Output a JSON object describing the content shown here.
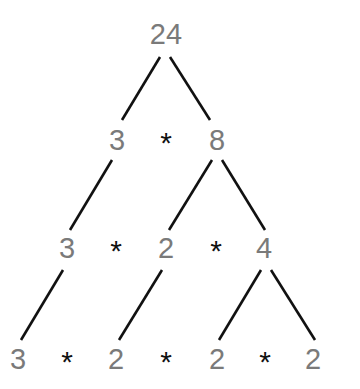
{
  "diagram": {
    "type": "factor-tree",
    "root": "24",
    "colors": {
      "number": "#7a7a7a",
      "operator": "#111111",
      "edge": "#111111",
      "background": "#ffffff"
    },
    "rows": [
      {
        "tokens": [
          {
            "text": "24",
            "kind": "num",
            "x": 166,
            "y": 34
          }
        ]
      },
      {
        "tokens": [
          {
            "text": "3",
            "kind": "num",
            "x": 117,
            "y": 140
          },
          {
            "text": "*",
            "kind": "op",
            "x": 166,
            "y": 143
          },
          {
            "text": "8",
            "kind": "num",
            "x": 217,
            "y": 140
          }
        ]
      },
      {
        "tokens": [
          {
            "text": "3",
            "kind": "num",
            "x": 67,
            "y": 248
          },
          {
            "text": "*",
            "kind": "op",
            "x": 116,
            "y": 251
          },
          {
            "text": "2",
            "kind": "num",
            "x": 166,
            "y": 248
          },
          {
            "text": "*",
            "kind": "op",
            "x": 216,
            "y": 251
          },
          {
            "text": "4",
            "kind": "num",
            "x": 264,
            "y": 248
          }
        ]
      },
      {
        "tokens": [
          {
            "text": "3",
            "kind": "num",
            "x": 18,
            "y": 359
          },
          {
            "text": "*",
            "kind": "op",
            "x": 67,
            "y": 362
          },
          {
            "text": "2",
            "kind": "num",
            "x": 116,
            "y": 359
          },
          {
            "text": "*",
            "kind": "op",
            "x": 166,
            "y": 362
          },
          {
            "text": "2",
            "kind": "num",
            "x": 217,
            "y": 359
          },
          {
            "text": "*",
            "kind": "op",
            "x": 265,
            "y": 362
          },
          {
            "text": "2",
            "kind": "num",
            "x": 313,
            "y": 359
          }
        ]
      }
    ],
    "edges": [
      {
        "from": "24",
        "to": "3",
        "x1": 160,
        "y1": 57,
        "x2": 122,
        "y2": 120
      },
      {
        "from": "24",
        "to": "8",
        "x1": 170,
        "y1": 57,
        "x2": 210,
        "y2": 120
      },
      {
        "from": "3",
        "to": "3",
        "x1": 112,
        "y1": 160,
        "x2": 70,
        "y2": 230
      },
      {
        "from": "8",
        "to": "2",
        "x1": 212,
        "y1": 160,
        "x2": 169,
        "y2": 230
      },
      {
        "from": "8",
        "to": "4",
        "x1": 222,
        "y1": 160,
        "x2": 265,
        "y2": 230
      },
      {
        "from": "3",
        "to": "3",
        "x1": 63,
        "y1": 270,
        "x2": 21,
        "y2": 340
      },
      {
        "from": "2",
        "to": "2",
        "x1": 162,
        "y1": 270,
        "x2": 119,
        "y2": 340
      },
      {
        "from": "4",
        "to": "2",
        "x1": 261,
        "y1": 270,
        "x2": 219,
        "y2": 340
      },
      {
        "from": "4",
        "to": "2",
        "x1": 271,
        "y1": 270,
        "x2": 315,
        "y2": 340
      }
    ]
  }
}
